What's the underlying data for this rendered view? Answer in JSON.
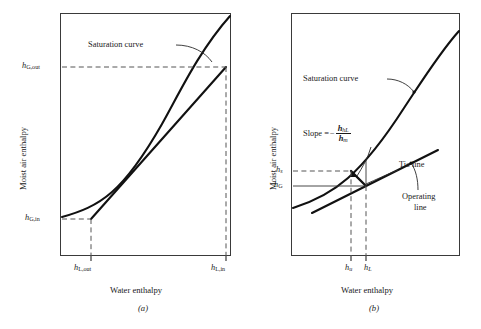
{
  "figure": {
    "kind": "enthalpy-driving-force-diagrams",
    "panels": [
      {
        "id": "a",
        "caption": "(a)",
        "axes": {
          "xlabel": "Water enthalpy",
          "ylabel": "Moist air enthalpy",
          "x_ticks": [
            {
              "key": "hLout",
              "base": "h",
              "sub": "L,out",
              "value_frac": 0.175
            },
            {
              "key": "hLin",
              "base": "h",
              "sub": "L,in",
              "value_frac": 0.935
            }
          ],
          "y_ticks": [
            {
              "key": "hGout",
              "base": "h",
              "sub": "G,out",
              "value_frac": 0.8
            },
            {
              "key": "hGin",
              "base": "h",
              "sub": "G,in",
              "value_frac": 0.198
            }
          ]
        },
        "annotations": [
          {
            "key": "saturation-curve",
            "text": "Saturation curve"
          }
        ]
      },
      {
        "id": "b",
        "caption": "(b)",
        "axes": {
          "xlabel": "Water enthalpy",
          "ylabel": "Moist air enthalpy",
          "x_ticks": [
            {
              "key": "hu",
              "base": "h",
              "sub": "u",
              "value_frac": 0.415
            },
            {
              "key": "hL",
              "base": "h",
              "sub": "L",
              "value_frac": 0.535
            }
          ],
          "y_ticks": [
            {
              "key": "hs",
              "base": "h",
              "sub": "s",
              "value_frac": 0.505
            },
            {
              "key": "hG",
              "base": "h",
              "sub": "G",
              "value_frac": 0.395
            }
          ]
        },
        "annotations": [
          {
            "key": "saturation-curve",
            "text": "Saturation curve"
          },
          {
            "key": "tie-line",
            "text": "Tie line"
          },
          {
            "key": "operating-line-1",
            "text": "Operating"
          },
          {
            "key": "operating-line-2",
            "text": "line"
          }
        ],
        "slope_expression": {
          "label": "Slope =",
          "minus": "−",
          "numerator_base": "h",
          "numerator_sub": "hL",
          "denominator_base": "h",
          "denominator_sub": "m"
        }
      }
    ],
    "colors": {
      "frame": "#3a3a3a",
      "curve": "#111111",
      "dashed": "#555555",
      "text": "#1a1a1a"
    }
  }
}
